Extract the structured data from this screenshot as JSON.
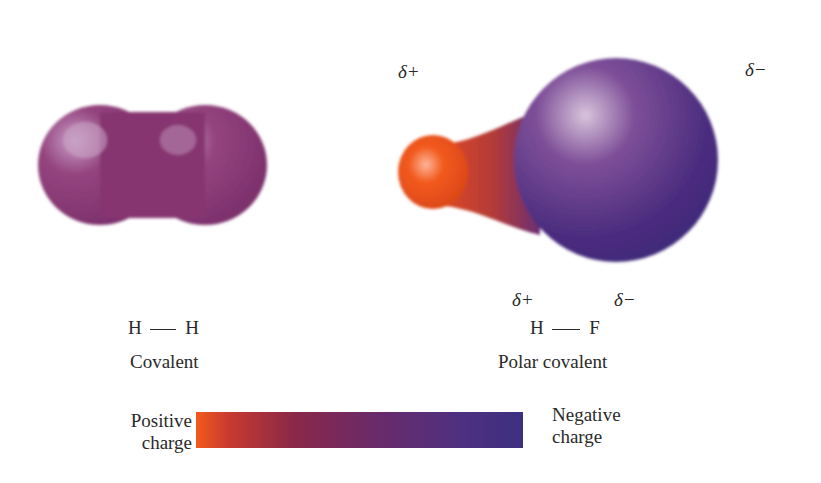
{
  "diagram": {
    "left_molecule": {
      "formula_left": "H",
      "formula_right": "H",
      "label": "Covalent",
      "color": "#8a3a78"
    },
    "right_molecule": {
      "top_left_charge": "δ+",
      "top_right_charge": "δ−",
      "atom_charge_left": "δ+",
      "atom_charge_right": "δ−",
      "formula_left": "H",
      "formula_right": "F",
      "label": "Polar covalent",
      "positive_color": "#f25a1c",
      "negative_color": "#4a2c7e"
    },
    "legend": {
      "left_line1": "Positive",
      "left_line2": "charge",
      "right_line1": "Negative",
      "right_line2": "charge",
      "gradient_start": "#f25a1c",
      "gradient_end": "#3e2f80"
    }
  }
}
